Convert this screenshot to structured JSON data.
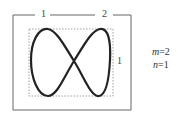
{
  "diagram": {
    "top_labels": [
      "1",
      "2"
    ],
    "side_label": "1",
    "params": {
      "m_label": "m",
      "m_value": "=2",
      "n_label": "n",
      "n_value": "=1"
    },
    "colors": {
      "curve": "#222222",
      "frame": "#666666",
      "dotted": "#888888"
    }
  }
}
